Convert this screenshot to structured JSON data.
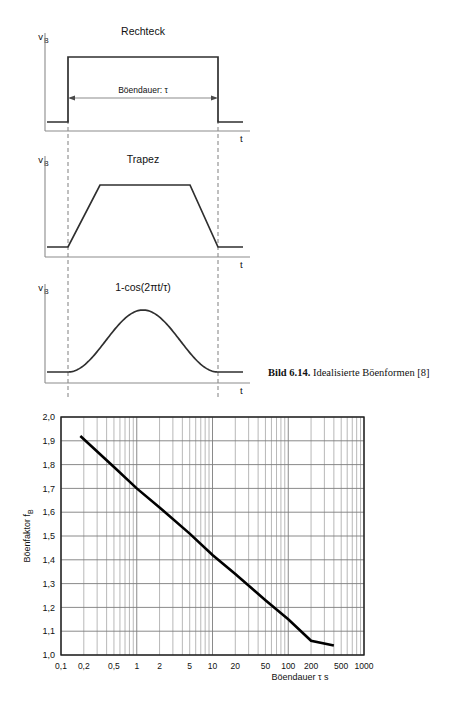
{
  "figure": {
    "caption_label": "Bild 6.14.",
    "caption_text": "Idealisierte Böenformen [8]",
    "panels": [
      {
        "id": "rechteck",
        "title": "Rechteck",
        "y_axis_label": "v",
        "y_axis_sub": "B",
        "x_axis_label": "t",
        "dimension_label": "Böendauer: τ"
      },
      {
        "id": "trapez",
        "title": "Trapez",
        "y_axis_label": "v",
        "y_axis_sub": "B",
        "x_axis_label": "t"
      },
      {
        "id": "cosine",
        "title": "1-cos(2πt/τ)",
        "y_axis_label": "v",
        "y_axis_sub": "B",
        "x_axis_label": "t"
      }
    ]
  },
  "chart_data": {
    "type": "line",
    "title": "",
    "xlabel": "Böendauer τ s",
    "ylabel": "Böenfaktor  f",
    "ylabel_sub": "B",
    "xscale": "log",
    "yscale": "linear",
    "xlim": [
      0.1,
      1000
    ],
    "ylim": [
      1.0,
      2.0
    ],
    "grid": true,
    "legend": "none",
    "xticks": [
      0.1,
      0.2,
      0.5,
      1,
      2,
      5,
      10,
      20,
      50,
      100,
      200,
      500,
      1000
    ],
    "xticklabels": [
      "0,1",
      "0,2",
      "0,5",
      "1",
      "2",
      "5",
      "10",
      "20",
      "50",
      "100",
      "200",
      "500",
      "1000"
    ],
    "yticks": [
      1.0,
      1.1,
      1.2,
      1.3,
      1.4,
      1.5,
      1.6,
      1.7,
      1.8,
      1.9,
      2.0
    ],
    "yticklabels": [
      "1,0",
      "1,1",
      "1,2",
      "1,3",
      "1,4",
      "1,5",
      "1,6",
      "1,7",
      "1,8",
      "1,9",
      "2,0"
    ],
    "series": [
      {
        "name": "Böenfaktor",
        "x": [
          0.18,
          0.5,
          1,
          2,
          5,
          10,
          20,
          50,
          100,
          200,
          400
        ],
        "y": [
          1.92,
          1.79,
          1.7,
          1.62,
          1.51,
          1.42,
          1.34,
          1.23,
          1.15,
          1.06,
          1.04
        ]
      }
    ]
  }
}
